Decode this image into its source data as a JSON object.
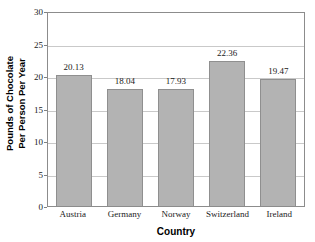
{
  "chart_data": {
    "type": "bar",
    "title": "",
    "subtitle": "",
    "xlabel": "Country",
    "ylabel_line1": "Pounds of Chocolate",
    "ylabel_line2": "Per Person Per Year",
    "categories": [
      "Austria",
      "Germany",
      "Norway",
      "Switzerland",
      "Ireland"
    ],
    "values": [
      20.13,
      18.04,
      17.93,
      22.36,
      19.47
    ],
    "value_labels": [
      "20.13",
      "18.04",
      "17.93",
      "22.36",
      "19.47"
    ],
    "ylim": [
      0,
      30
    ],
    "ytick_values": [
      0,
      5,
      10,
      15,
      20,
      25,
      30
    ],
    "ytick_labels": [
      "0",
      "5",
      "10",
      "15",
      "20",
      "25",
      "30"
    ],
    "grid": "horizontal",
    "legend": "none",
    "bar_color": "#b3b3b3",
    "bar_edge_color": "#8f8f8f",
    "gridline_color": "#c9c9c9",
    "frame_color": "#8c8c8c",
    "background": "#ffffff"
  }
}
